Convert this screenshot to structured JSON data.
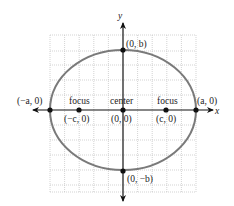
{
  "diagram": {
    "type": "ellipse-on-coordinate-grid",
    "axes": {
      "x_label": "x",
      "y_label": "y"
    },
    "colors": {
      "ellipse": "#7a7a7a",
      "axes": "#111111",
      "grid": "#c8c8c8",
      "points": "#111111",
      "text": "#222222"
    },
    "labels": {
      "vertex_left": "(−a, 0)",
      "vertex_right": "(a, 0)",
      "covertex_top": "(0, b)",
      "covertex_bottom": "(0, −b)",
      "focus_left_word": "focus",
      "focus_left_coord": "(−c, 0)",
      "center_word": "center",
      "center_coord": "(0, 0)",
      "focus_right_word": "focus",
      "focus_right_coord": "(c, 0)"
    },
    "points": [
      {
        "name": "vertex-left",
        "label": "(−a, 0)"
      },
      {
        "name": "focus-left",
        "label": "(−c, 0)"
      },
      {
        "name": "center",
        "label": "(0, 0)"
      },
      {
        "name": "focus-right",
        "label": "(c, 0)"
      },
      {
        "name": "vertex-right",
        "label": "(a, 0)"
      },
      {
        "name": "covertex-top",
        "label": "(0, b)"
      },
      {
        "name": "covertex-bottom",
        "label": "(0, −b)"
      }
    ]
  }
}
